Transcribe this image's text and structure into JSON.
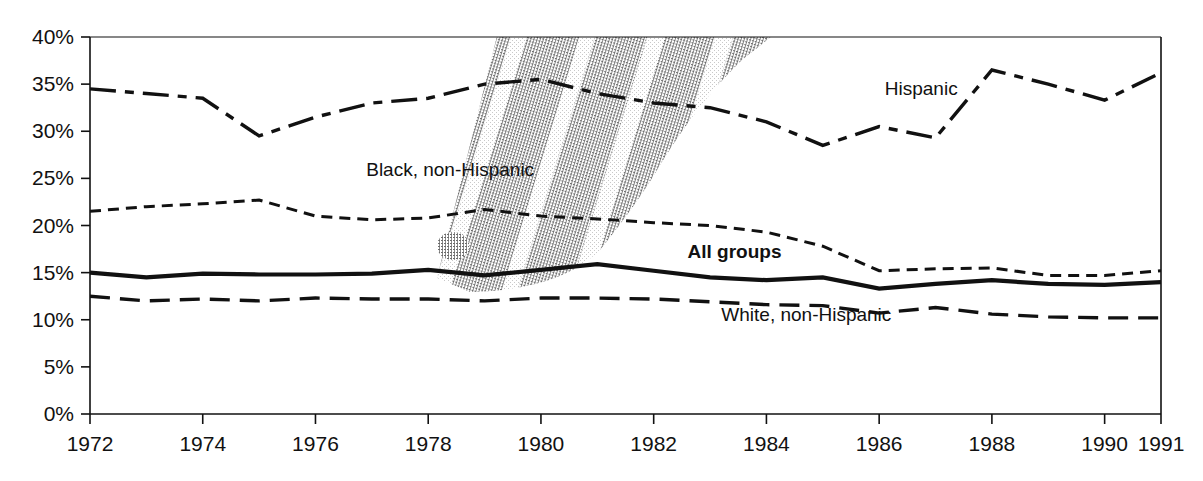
{
  "chart_data": {
    "type": "line",
    "title": "",
    "xlabel": "",
    "ylabel": "",
    "xlim": [
      1972,
      1991
    ],
    "ylim": [
      0,
      40
    ],
    "ytick_labels": [
      "0%",
      "5%",
      "10%",
      "15%",
      "20%",
      "25%",
      "30%",
      "35%",
      "40%"
    ],
    "ytick_values": [
      0,
      5,
      10,
      15,
      20,
      25,
      30,
      35,
      40
    ],
    "xtick_labels": [
      "1972",
      "1974",
      "1976",
      "1978",
      "1980",
      "1982",
      "1984",
      "1986",
      "1988",
      "1990",
      "1991"
    ],
    "xtick_values": [
      1972,
      1974,
      1976,
      1978,
      1980,
      1982,
      1984,
      1986,
      1988,
      1990,
      1991
    ],
    "grid": false,
    "legend_position": "inline-annotations",
    "x": [
      1972,
      1973,
      1974,
      1975,
      1976,
      1977,
      1978,
      1979,
      1980,
      1981,
      1982,
      1983,
      1984,
      1985,
      1986,
      1987,
      1988,
      1989,
      1990,
      1991
    ],
    "series": [
      {
        "name": "Hispanic",
        "style": "dash-dot",
        "label_x": 1986.1,
        "label_y": 33.8,
        "values": [
          34.5,
          34.0,
          33.5,
          29.5,
          31.5,
          33.0,
          33.5,
          35.0,
          35.5,
          34.0,
          33.0,
          32.5,
          31.0,
          28.5,
          30.5,
          29.3,
          36.5,
          35.0,
          33.3,
          36.2
        ]
      },
      {
        "name": "Black, non-Hispanic",
        "style": "short-dash",
        "label_x": 1976.9,
        "label_y": 25.3,
        "values": [
          21.5,
          22.0,
          22.3,
          22.7,
          21.0,
          20.6,
          20.8,
          21.7,
          21.0,
          20.7,
          20.3,
          20.0,
          19.3,
          17.8,
          15.2,
          15.4,
          15.5,
          14.7,
          14.7,
          15.2
        ]
      },
      {
        "name": "All groups",
        "style": "solid",
        "bold_label": true,
        "label_x": 1982.6,
        "label_y": 16.6,
        "values": [
          15.0,
          14.5,
          14.9,
          14.8,
          14.8,
          14.9,
          15.3,
          14.7,
          15.3,
          15.9,
          15.2,
          14.5,
          14.2,
          14.5,
          13.3,
          13.8,
          14.2,
          13.8,
          13.7,
          14.0
        ]
      },
      {
        "name": "White, non-Hispanic",
        "style": "long-dash",
        "label_x": 1983.2,
        "label_y": 9.9,
        "values": [
          12.5,
          12.0,
          12.2,
          12.0,
          12.3,
          12.2,
          12.2,
          12.0,
          12.3,
          12.3,
          12.2,
          11.9,
          11.6,
          11.5,
          10.7,
          11.3,
          10.6,
          10.3,
          10.2,
          10.2
        ]
      }
    ],
    "artifact": {
      "name": "scan-smudge",
      "description": "diagonal photocopy smudge with striped bands over 1978-1983 region"
    }
  }
}
